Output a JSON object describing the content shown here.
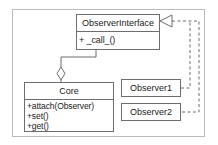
{
  "diagram": {
    "colors": {
      "frame_border": "#b9b9b9",
      "box_border": "#6d6d6d",
      "line": "#6d6d6d",
      "text": "#1a1a1a",
      "background": "#ffffff"
    },
    "classes": {
      "observer_interface": {
        "name": "ObserverInterface",
        "members": [
          "+ _call_()"
        ]
      },
      "core": {
        "name": "Core",
        "members": [
          "+attach(Observer)",
          "+set()",
          "+get()"
        ]
      },
      "observer1": {
        "name": "Observer1",
        "members": []
      },
      "observer2": {
        "name": "Observer2",
        "members": []
      }
    },
    "relations": [
      {
        "name": "core-aggregates-observer-interface",
        "from": "Core",
        "to": "ObserverInterface",
        "type": "aggregation",
        "marker": "hollow-diamond",
        "style": "solid"
      },
      {
        "name": "observer1-realizes-observer-interface",
        "from": "Observer1",
        "to": "ObserverInterface",
        "type": "realization",
        "marker": "hollow-triangle",
        "style": "dashed"
      },
      {
        "name": "observer2-realizes-observer-interface",
        "from": "Observer2",
        "to": "ObserverInterface",
        "type": "realization",
        "marker": "hollow-triangle",
        "style": "dashed"
      }
    ]
  }
}
